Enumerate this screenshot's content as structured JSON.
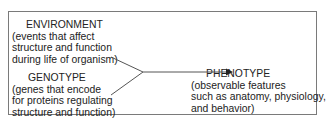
{
  "diagram": {
    "nodes": {
      "environment": {
        "title": "ENVIRONMENT",
        "lines": [
          "(events that affect",
          "structure and function",
          "during life of organism)"
        ]
      },
      "genotype": {
        "title": "GENOTYPE",
        "lines": [
          "(genes that encode",
          "for proteins regulating",
          "structure and function)"
        ]
      },
      "phenotype": {
        "title": "PHENOTYPE",
        "lines": [
          "(observable features",
          "such as anatomy, physiology,",
          "and behavior)"
        ]
      }
    },
    "edges": [
      {
        "from": "environment",
        "to": "phenotype"
      },
      {
        "from": "genotype",
        "to": "phenotype"
      }
    ],
    "colors": {
      "border": "#7a7a7a",
      "line": "#555555",
      "text": "#222222"
    }
  }
}
